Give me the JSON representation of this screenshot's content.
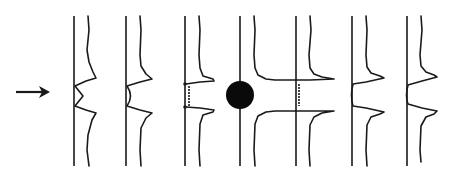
{
  "diagram": {
    "colors": {
      "ink": "#1a1a1a",
      "background": "#ffffff"
    },
    "arrow": {
      "icon": "right-arrow-icon",
      "direction": "right"
    },
    "panels": [
      {
        "index": 1,
        "state": "pulse-approaching"
      },
      {
        "index": 2,
        "state": "pulse-approaching"
      },
      {
        "index": 3,
        "state": "pulse-near-ball"
      },
      {
        "index": 4,
        "state": "pulse-at-ball",
        "has_ball": true
      },
      {
        "index": 5,
        "state": "pulse-leaving"
      },
      {
        "index": 6,
        "state": "pulse-leaving"
      },
      {
        "index": 7,
        "state": "pulse-leaving"
      }
    ]
  }
}
